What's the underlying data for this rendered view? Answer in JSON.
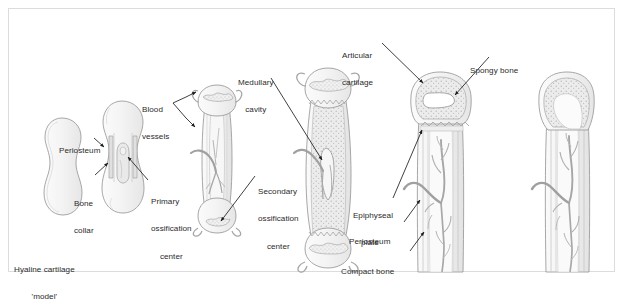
{
  "figure": {
    "background_color": "#ffffff",
    "frame_color": "#dcdcdc",
    "ink_color": "#6e6e6e",
    "label_color": "#2b2b2b",
    "vessel_color": "#9a9a9a",
    "cartilage_fill": "#f6f6f6",
    "bone_fill": "#ededed",
    "spongy_fill": "#e2e2e2"
  },
  "labels": [
    {
      "id": "hyaline-cartilage-model",
      "line1": "Hyaline cartilage",
      "line2": "'model'",
      "x": 14,
      "y": 246,
      "align": "left"
    },
    {
      "id": "periosteum-stage2",
      "line1": "Periosteum",
      "line2": "",
      "x": 59,
      "y": 127,
      "align": "left"
    },
    {
      "id": "bone-collar",
      "line1": "Bone",
      "line2": "collar",
      "x": 74,
      "y": 180,
      "align": "left"
    },
    {
      "id": "primary-ossification-center",
      "line1": "Primary",
      "line2": "ossification",
      "line3": "center",
      "x": 151,
      "y": 178,
      "align": "left"
    },
    {
      "id": "blood-vessels",
      "line1": "Blood",
      "line2": "vessels",
      "x": 142,
      "y": 86,
      "align": "left"
    },
    {
      "id": "secondary-ossification-center",
      "line1": "Secondary",
      "line2": "ossification",
      "line3": "center",
      "x": 258,
      "y": 168,
      "align": "left"
    },
    {
      "id": "medullary-cavity",
      "line1": "Medullary",
      "line2": "cavity",
      "x": 238,
      "y": 59,
      "align": "left"
    },
    {
      "id": "articular-cartilage",
      "line1": "Articular",
      "line2": "cartilage",
      "x": 342,
      "y": 32,
      "align": "left"
    },
    {
      "id": "spongy-bone",
      "line1": "Spongy bone",
      "line2": "",
      "x": 470,
      "y": 47,
      "align": "left"
    },
    {
      "id": "epiphyseal-plate",
      "line1": "Epiphyseal",
      "line2": "plate",
      "x": 355,
      "y": 192,
      "align": "left"
    },
    {
      "id": "periosteum-stage5",
      "line1": "Periosteum",
      "line2": "",
      "x": 364,
      "y": 227,
      "align": "left"
    },
    {
      "id": "compact-bone",
      "line1": "Compact bone",
      "line2": "",
      "x": 355,
      "y": 255,
      "align": "left"
    }
  ],
  "stages": [
    {
      "id": "stage-1",
      "name": "hyaline-cartilage-model",
      "order": 1
    },
    {
      "id": "stage-2",
      "name": "bone-collar-formation",
      "order": 2
    },
    {
      "id": "stage-3",
      "name": "primary-ossification-center",
      "order": 3
    },
    {
      "id": "stage-4",
      "name": "medullary-cavity-formation",
      "order": 4
    },
    {
      "id": "stage-5",
      "name": "secondary-ossification-epiphyseal-plate",
      "order": 5
    },
    {
      "id": "stage-6",
      "name": "mature-bone",
      "order": 6
    }
  ],
  "leaders": [
    {
      "id": "leader-periosteum-2",
      "from": "periosteum-stage2",
      "to": "stage-2"
    },
    {
      "id": "leader-bone-collar",
      "from": "bone-collar",
      "to": "stage-2"
    },
    {
      "id": "leader-primary-oc",
      "from": "primary-ossification-center",
      "to": "stage-2"
    },
    {
      "id": "leader-blood-vessels-upper",
      "from": "blood-vessels",
      "to": "stage-3"
    },
    {
      "id": "leader-blood-vessels-lower",
      "from": "blood-vessels",
      "to": "stage-3"
    },
    {
      "id": "leader-secondary-oc",
      "from": "secondary-ossification-center",
      "to": "stage-3"
    },
    {
      "id": "leader-medullary-cavity",
      "from": "medullary-cavity",
      "to": "stage-4"
    },
    {
      "id": "leader-articular-cartilage",
      "from": "articular-cartilage",
      "to": "stage-5"
    },
    {
      "id": "leader-spongy-bone",
      "from": "spongy-bone",
      "to": "stage-5"
    },
    {
      "id": "leader-epiphyseal-plate",
      "from": "epiphyseal-plate",
      "to": "stage-5"
    },
    {
      "id": "leader-periosteum-5",
      "from": "periosteum-stage5",
      "to": "stage-5"
    },
    {
      "id": "leader-compact-bone",
      "from": "compact-bone",
      "to": "stage-5"
    }
  ]
}
